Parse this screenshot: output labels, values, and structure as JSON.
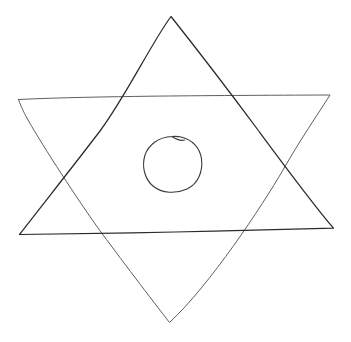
{
  "canvas": {
    "width": 351,
    "height": 342,
    "background_color": "#ffffff",
    "title": "Hand-drawn hexagram sketch"
  },
  "drawing": {
    "description": "Freehand pen sketch of a six-pointed star (Star of David / hexagram) formed by two overlapping triangles, with a small hand-drawn circle near the center.",
    "medium": "pen on white paper",
    "ink_color": "#2b2b2b",
    "ink_color_light": "#6e6e6e",
    "stroke_width": 1.1,
    "shapes": [
      {
        "id": "triangle-down",
        "name": "downward-pointing-triangle",
        "label": "Downward triangle",
        "stroke_color": "#5e5e5e",
        "stroke_width": 1.0,
        "vertices": [
          {
            "label": "top-left",
            "x": 18,
            "y": 99
          },
          {
            "label": "top-right",
            "x": 330,
            "y": 95
          },
          {
            "label": "bottom-apex",
            "x": 169,
            "y": 323
          }
        ],
        "path": "M 18.5 99.5 C 60 97.5, 110 96.8, 150 96.2 C 200 95.6, 270 95.2, 330 95.0 C 318 114, 300 140, 283 170 C 262 206, 210 285, 169.5 322.5 C 152 300, 120 258, 98 228 C 78 200, 44 148, 28 120 C 23 111, 19.5 103, 18.5 99.5 Z"
      },
      {
        "id": "triangle-up",
        "name": "upward-pointing-triangle",
        "label": "Upward triangle",
        "stroke_color": "#2b2b2b",
        "stroke_width": 1.25,
        "vertices": [
          {
            "label": "top-apex",
            "x": 171,
            "y": 16
          },
          {
            "label": "bottom-right",
            "x": 334,
            "y": 228
          },
          {
            "label": "bottom-left",
            "x": 19,
            "y": 234
          }
        ],
        "path": "M 171 16.5 C 192 43, 232 95, 258 130 C 278 157, 312 203, 333.5 228.2 C 290 229.5, 230 230.8, 175 232 C 120 233.2, 55 234.2, 19.5 234.5 C 40 208, 78 160, 100 131 C 126 96, 152 42, 171 16.5 Z"
      },
      {
        "id": "center-circle",
        "name": "center-circle",
        "label": "Center circle",
        "stroke_color": "#3a3a3a",
        "stroke_width": 1.1,
        "center": {
          "x": 173,
          "y": 164
        },
        "radius_x": 29,
        "radius_y": 28,
        "bounds": {
          "left": 144,
          "top": 136,
          "right": 202,
          "bottom": 192
        },
        "path": "M 172 136.5 C 158 137, 148.5 145, 145 155 C 141.5 166, 144.5 179, 153 186 C 162 193.5, 176 194, 187 189 C 198.5 183.5, 203 171, 201.5 159 C 200 147.5, 192 139.5, 181 137 C 178 136.3, 175 136.3, 172 136.5 Z M 172 136.5 C 176.5 139.5, 181 141, 184.5 140"
      }
    ],
    "intersections": [
      {
        "name": "left-crossing",
        "x": 60,
        "y": 172
      },
      {
        "name": "right-crossing",
        "x": 283,
        "y": 170
      },
      {
        "name": "upper-left-crossing",
        "x": 100,
        "y": 97
      },
      {
        "name": "upper-right-crossing",
        "x": 245,
        "y": 96
      },
      {
        "name": "lower-left-crossing",
        "x": 99,
        "y": 231
      },
      {
        "name": "lower-right-crossing",
        "x": 245,
        "y": 230
      }
    ]
  }
}
